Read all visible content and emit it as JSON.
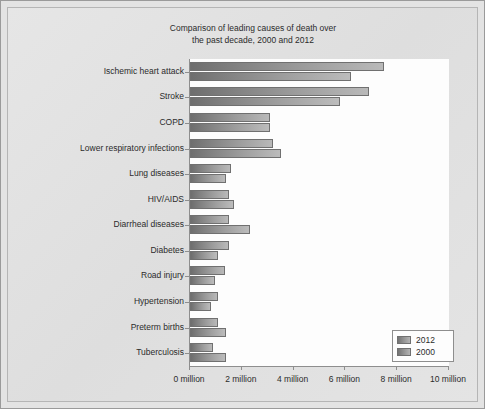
{
  "chart_data": {
    "type": "bar",
    "orientation": "horizontal",
    "title": "Comparison of leading causes of death over the past decade, 2000 and 2012",
    "title_lines": [
      "Comparison of leading causes of death over",
      "the past decade, 2000 and 2012"
    ],
    "xlabel": "",
    "ylabel": "",
    "xlim": [
      0,
      10
    ],
    "xticks": [
      0,
      2,
      4,
      6,
      8,
      10
    ],
    "xtick_labels": [
      "0 million",
      "2 million",
      "4 million",
      "6 million",
      "8 million",
      "10 million"
    ],
    "grid": false,
    "legend_position": "lower right",
    "categories": [
      "Ischemic heart attack",
      "Stroke",
      "COPD",
      "Lower respiratory infections",
      "Lung diseases",
      "HIV/AIDS",
      "Diarrheal diseases",
      "Diabetes",
      "Road injury",
      "Hypertension",
      "Preterm births",
      "Tuberculosis"
    ],
    "series": [
      {
        "name": "2012",
        "color": "#8d8d8d",
        "values": [
          7.5,
          6.9,
          3.1,
          3.2,
          1.6,
          1.5,
          1.5,
          1.5,
          1.35,
          1.1,
          1.1,
          0.9
        ]
      },
      {
        "name": "2000",
        "color": "#8d8d8d",
        "values": [
          6.2,
          5.8,
          3.1,
          3.5,
          1.4,
          1.7,
          2.3,
          1.1,
          0.95,
          0.8,
          1.4,
          1.4
        ]
      }
    ],
    "legend": [
      "2012",
      "2000"
    ]
  },
  "colors": {
    "figure_background": "#e3e3e3",
    "plot_background": "#fdfdfd",
    "axis": "#8e8e8e",
    "text": "#2b2b2b",
    "bar_light": "#bcbcbc",
    "bar_dark": "#6e6e6e"
  }
}
